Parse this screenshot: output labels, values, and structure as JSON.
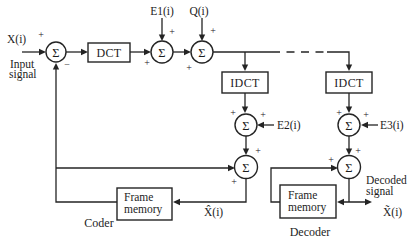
{
  "figure": {
    "kind": "hybrid-DCT-codec-block-diagram",
    "glyphs": {
      "sum": "Σ",
      "plus": "+",
      "minus": "−"
    },
    "coder": {
      "input_var": "X(i)",
      "input_caption": [
        "Input",
        "signal"
      ],
      "dct_label": "DCT",
      "idct_label": "IDCT",
      "e1_label": "E1(i)",
      "q_label": "Q(i)",
      "e2_label": "E2(i)",
      "frame_memory": [
        "Frame",
        "memory"
      ],
      "reconstructed_var": "X̂(i)",
      "caption": "Coder"
    },
    "decoder": {
      "idct_label": "IDCT",
      "e3_label": "E3(i)",
      "frame_memory": [
        "Frame",
        "memory"
      ],
      "decoded_caption": [
        "Decoded",
        "signal"
      ],
      "output_var": "X̃(i)",
      "caption": "Decoder"
    },
    "colors": {
      "ink": "#242424",
      "paper": "#ffffff"
    }
  }
}
